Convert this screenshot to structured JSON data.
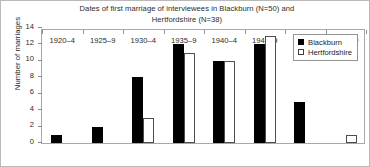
{
  "chart_data": {
    "type": "bar",
    "title": "Dates of first marriage of interviewees in Blackburn (N=50) and\nHertfordshire (N=38)",
    "xlabel": "",
    "ylabel": "Number of marriages",
    "categories": [
      "1920–4",
      "1925–9",
      "1930–4",
      "1935–9",
      "1940–4",
      "1945–9",
      "1950–4",
      "1955–9"
    ],
    "series": [
      {
        "name": "Blackburn",
        "values": [
          1,
          2,
          8,
          12,
          10,
          12,
          5,
          0
        ],
        "color": "#000000",
        "style": "filled"
      },
      {
        "name": "Hertfordshire",
        "values": [
          0,
          0,
          3,
          11,
          10,
          13,
          0,
          1
        ],
        "color": "#ffffff",
        "style": "open"
      }
    ],
    "ylim": [
      0,
      14
    ],
    "yticks": [
      0,
      2,
      4,
      6,
      8,
      10,
      12,
      14
    ],
    "ytick_labels": [
      "0",
      "2",
      "4",
      "6",
      "8",
      "10",
      "12",
      "14"
    ],
    "grid": false,
    "legend_position": "top-right",
    "legend_entries": [
      "Blackburn",
      "Hertfordshire"
    ]
  }
}
